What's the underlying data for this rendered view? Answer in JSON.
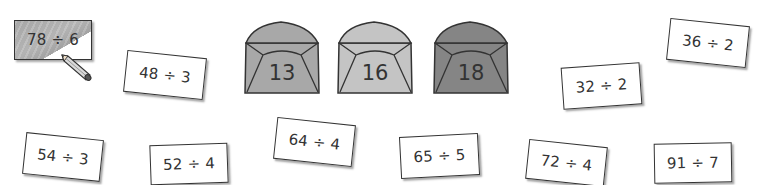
{
  "envelopes": [
    {
      "label": "13",
      "color": "#a8a8a8"
    },
    {
      "label": "16",
      "color": "#c4c4c4"
    },
    {
      "label": "18",
      "color": "#858585"
    }
  ],
  "cards": [
    {
      "expression": "78 ÷ 6",
      "shaded": true
    },
    {
      "expression": "48 ÷ 3",
      "shaded": false
    },
    {
      "expression": "32 ÷ 2",
      "shaded": false
    },
    {
      "expression": "36 ÷ 2",
      "shaded": false
    },
    {
      "expression": "54 ÷ 3",
      "shaded": false
    },
    {
      "expression": "52 ÷ 4",
      "shaded": false
    },
    {
      "expression": "64 ÷ 4",
      "shaded": false
    },
    {
      "expression": "65 ÷ 5",
      "shaded": false
    },
    {
      "expression": "72 ÷ 4",
      "shaded": false
    },
    {
      "expression": "91 ÷ 7",
      "shaded": false
    }
  ]
}
